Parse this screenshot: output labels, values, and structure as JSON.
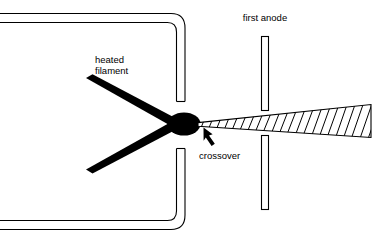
{
  "figure": {
    "title_visible": false,
    "background_color": "#ffffff",
    "ink_color": "#000000",
    "width": 381,
    "height": 244
  },
  "labels": {
    "heated_filament_line1": "heated",
    "heated_filament_line2": "filament",
    "first_anode": "first anode",
    "crossover": "crossover"
  },
  "components": {
    "wehnelt_cylinder": {
      "name": "wehnelt-cylinder-wall",
      "style": "double-line-outline",
      "open_left": true
    },
    "filament": {
      "name": "heated-filament",
      "shape": "hairpin-v",
      "fill": "#000000"
    },
    "crossover_spot": {
      "name": "crossover-spot",
      "shape": "ellipse",
      "fill": "#000000",
      "cx": 184,
      "cy": 124,
      "rx": 16,
      "ry": 11
    },
    "electron_beam": {
      "name": "electron-beam",
      "shape": "diverging-hatched-wedge",
      "hatch": "diagonal"
    },
    "first_anode_plates": {
      "name": "first-anode-plates",
      "count": 2,
      "fill": "#ffffff",
      "stroke": "#000000"
    },
    "pointer": {
      "name": "crossover-arrow",
      "direction": "up-left"
    }
  }
}
